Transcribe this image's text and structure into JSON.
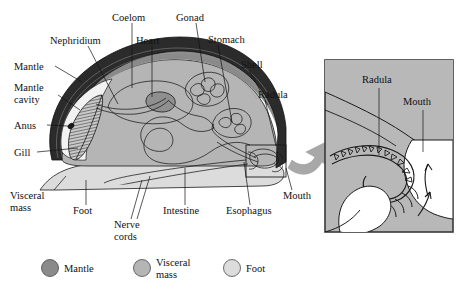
{
  "figure": {
    "type": "anatomical-diagram",
    "background": "#ffffff"
  },
  "colors": {
    "shell": "#2b2b2b",
    "shell_inner": "#6e6e6e",
    "mantle": "#8a8a8a",
    "visceral_mass": "#b5b5b5",
    "foot": "#dcdcdc",
    "inset_bg": "#b8b8b8",
    "inset_border": "#3a3a3a",
    "arrow": "#a8a8a8",
    "outline": "#1a1a1a",
    "text": "#111111"
  },
  "main_labels": [
    {
      "id": "nephridium",
      "text": "Nephridium",
      "x": 50,
      "y": 41,
      "anchor": "start",
      "lines": [
        "Nephridium"
      ]
    },
    {
      "id": "coelom",
      "text": "Coelom",
      "x": 115,
      "y": 18,
      "anchor": "start",
      "lines": [
        "Coelom"
      ]
    },
    {
      "id": "gonad",
      "text": "Gonad",
      "x": 175,
      "y": 18,
      "anchor": "start",
      "lines": [
        "Gonad"
      ]
    },
    {
      "id": "heart",
      "text": "Heart",
      "x": 135,
      "y": 41,
      "anchor": "start",
      "lines": [
        "Heart"
      ]
    },
    {
      "id": "stomach",
      "text": "Stomach",
      "x": 208,
      "y": 40,
      "anchor": "start",
      "lines": [
        "Stomach"
      ]
    },
    {
      "id": "shell",
      "text": "Shell",
      "x": 240,
      "y": 65,
      "anchor": "start",
      "lines": [
        "Shell"
      ]
    },
    {
      "id": "radula",
      "text": "Radula",
      "x": 258,
      "y": 95,
      "anchor": "start",
      "lines": [
        "Radula"
      ]
    },
    {
      "id": "mantle",
      "text": "Mantle",
      "x": 14,
      "y": 69,
      "anchor": "start",
      "lines": [
        "Mantle"
      ]
    },
    {
      "id": "mantle-cavity",
      "text": "Mantle cavity",
      "x": 14,
      "y": 92,
      "anchor": "start",
      "lines": [
        "Mantle",
        "cavity"
      ]
    },
    {
      "id": "anus",
      "text": "Anus",
      "x": 14,
      "y": 128,
      "anchor": "start",
      "lines": [
        "Anus"
      ]
    },
    {
      "id": "gill",
      "text": "Gill",
      "x": 14,
      "y": 155,
      "anchor": "start",
      "lines": [
        "Gill"
      ]
    },
    {
      "id": "visceral-mass",
      "text": "Visceral mass",
      "x": 10,
      "y": 199,
      "anchor": "start",
      "lines": [
        "Visceral",
        "mass"
      ]
    },
    {
      "id": "foot",
      "text": "Foot",
      "x": 76,
      "y": 212,
      "anchor": "start",
      "lines": [
        "Foot"
      ]
    },
    {
      "id": "nerve-cords",
      "text": "Nerve cords",
      "x": 113,
      "y": 226,
      "anchor": "start",
      "lines": [
        "Nerve",
        "cords"
      ]
    },
    {
      "id": "intestine",
      "text": "Intestine",
      "x": 165,
      "y": 212,
      "anchor": "start",
      "lines": [
        "Intestine"
      ]
    },
    {
      "id": "esophagus",
      "text": "Esophagus",
      "x": 228,
      "y": 212,
      "anchor": "start",
      "lines": [
        "Esophagus"
      ]
    },
    {
      "id": "mouth",
      "text": "Mouth",
      "x": 281,
      "y": 196,
      "anchor": "start",
      "lines": [
        "Mouth"
      ]
    }
  ],
  "inset": {
    "title": "Radula detail",
    "labels": [
      {
        "id": "inset-radula",
        "text": "Radula",
        "x": 362,
        "y": 83
      },
      {
        "id": "inset-mouth",
        "text": "Mouth",
        "x": 408,
        "y": 105
      }
    ]
  },
  "legend": {
    "items": [
      {
        "id": "legend-mantle",
        "label": "Mantle",
        "lines": [
          "Mantle"
        ],
        "color": "#8a8a8a",
        "cx": 50,
        "cy": 268
      },
      {
        "id": "legend-visceral-mass",
        "label": "Visceral mass",
        "lines": [
          "Visceral",
          "mass"
        ],
        "color": "#b5b5b5",
        "cx": 142,
        "cy": 268
      },
      {
        "id": "legend-foot",
        "label": "Foot",
        "lines": [
          "Foot"
        ],
        "color": "#dcdcdc",
        "cx": 232,
        "cy": 268
      }
    ]
  }
}
